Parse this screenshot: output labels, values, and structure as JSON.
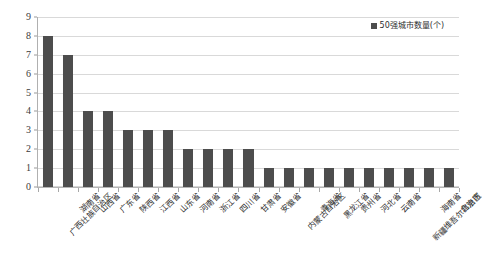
{
  "chart_data": {
    "type": "bar",
    "title": "",
    "xlabel": "",
    "ylabel": "",
    "ylim": [
      0,
      9
    ],
    "ytick_step": 1,
    "yticks": [
      9,
      8,
      7,
      6,
      5,
      4,
      3,
      2,
      1,
      0
    ],
    "grid": true,
    "legend_position": "top-right",
    "series": [
      {
        "name": "50强城市数量(个)",
        "color": "#4d4d4d",
        "values": [
          8,
          7,
          4,
          4,
          3,
          3,
          3,
          2,
          2,
          2,
          2,
          1,
          1,
          1,
          1,
          1,
          1,
          1,
          1,
          1,
          1
        ]
      }
    ],
    "categories": [
      "广西壮族自治区",
      "湖南省",
      "山西省",
      "广东省",
      "陕西省",
      "江西省",
      "山东省",
      "河南省",
      "浙江省",
      "四川省",
      "甘肃省",
      "安徽省",
      "内蒙古自治区",
      "青海省",
      "黑龙江省",
      "贵州省",
      "河北省",
      "云南省",
      "新疆维吾尔自治区",
      "海南省",
      "北京市"
    ]
  },
  "legend": {
    "entries": [
      {
        "label": "50强城市数量(个)",
        "color": "#4d4d4d"
      }
    ]
  },
  "colors": {
    "bar": "#4d4d4d",
    "gridline": "#d9d9d9",
    "axis": "#b0b0b0",
    "text": "#2e2e2e",
    "background": "#ffffff"
  }
}
